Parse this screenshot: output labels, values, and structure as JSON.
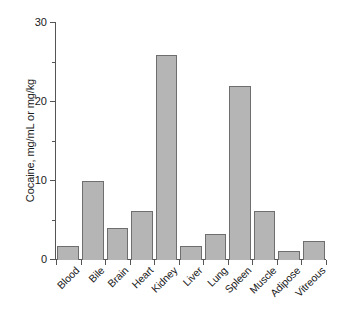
{
  "chart_data": {
    "type": "bar",
    "title": "",
    "subtitle": "",
    "xlabel": "",
    "ylabel": "Cocaine, mg/mL or mg/kg",
    "categories": [
      "Blood",
      "Bile",
      "Brain",
      "Heart",
      "Kidney",
      "Liver",
      "Lung",
      "Spleen",
      "Muscle",
      "Adipose",
      "Vitreous"
    ],
    "values": [
      1.8,
      10.0,
      4.0,
      6.2,
      26.0,
      1.8,
      3.3,
      22.0,
      6.2,
      1.2,
      2.4
    ],
    "ylim": [
      0,
      30
    ],
    "xlim_categories": 11,
    "yticks": [
      0,
      10,
      20,
      30
    ],
    "ytick_labels": [
      "0",
      "10",
      "20",
      "30"
    ],
    "yticks_minor": [
      5,
      15,
      25
    ],
    "grid": false,
    "legend": null,
    "legend_position": "none",
    "annotations": [],
    "bar_fill_color": "#b5b5b5",
    "bar_edge_color": "#6e6e6e",
    "axis_color": "#555555",
    "text_color": "#1a1a1a",
    "background_color": "#ffffff",
    "xlabel_rotation_deg": 45
  }
}
